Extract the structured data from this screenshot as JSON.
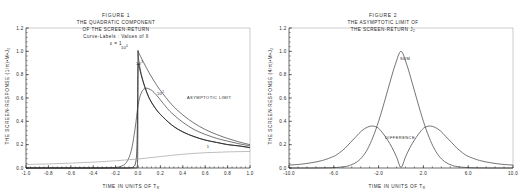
{
  "page": {
    "background_color": "#ffffff",
    "ink_color": "#1f1f1f"
  },
  "figure1": {
    "title_lines": {
      "line1": "FIGURE   1",
      "line2": "THE QUADRATIC COMPONENT",
      "line3": "OF THE SCREEN-RETURN",
      "line4": "Curve-Labels :  Values of δ",
      "line5": "ε = 1"
    },
    "ylabel": "THE SCREEN-RESPONSE  (1/π)•M•J",
    "ylabel_sub": "2",
    "xlabel": "TIME IN UNITS OF T",
    "xlabel_sub": "R",
    "annotations": {
      "asymptotic": "ASYMPTOTIC LIMIT",
      "curve_10_4_base": "10",
      "curve_10_4_exp": "4",
      "curve_10_3_base": "10",
      "curve_10_3_exp": "3",
      "curve_10_2_base": "10",
      "curve_10_2_exp": "2",
      "curve_1": "1"
    },
    "chart_data": {
      "type": "line",
      "title": "THE QUADRATIC COMPONENT OF THE SCREEN-RETURN",
      "xlabel": "TIME IN UNITS OF T_R",
      "ylabel": "THE SCREEN-RESPONSE (1/π)•M•J_2",
      "xlim": [
        -1.0,
        1.0
      ],
      "ylim": [
        0.0,
        1.2
      ],
      "xticks": [
        "-1.0",
        "-0.8",
        "-0.6",
        "-0.4",
        "-0.2",
        "0.0",
        "0.2",
        "0.4",
        "0.6",
        "0.8",
        "1.0"
      ],
      "xtick_values": [
        -1.0,
        -0.8,
        -0.6,
        -0.4,
        -0.2,
        0.0,
        0.2,
        0.4,
        0.6,
        0.8,
        1.0
      ],
      "yticks": [
        "0.0",
        "0.2",
        "0.4",
        "0.6",
        "0.8",
        "1.0",
        "1.2"
      ],
      "ytick_values": [
        0.0,
        0.2,
        0.4,
        0.6,
        0.8,
        1.0,
        1.2
      ],
      "grid": false,
      "legend": "curve labels in-plot",
      "series": [
        {
          "name": "delta = 10^4",
          "label": "10^4",
          "x": [
            -1.0,
            -0.6,
            -0.3,
            -0.12,
            -0.05,
            -0.02,
            -0.008,
            -0.003,
            -0.001,
            0.0,
            0.002,
            0.01,
            0.03,
            0.06,
            0.1,
            0.15,
            0.2,
            0.3,
            0.4,
            0.5,
            0.6,
            0.7,
            0.8,
            0.9,
            1.0
          ],
          "y": [
            0.0,
            0.0,
            0.0,
            0.0,
            0.0,
            0.001,
            0.01,
            0.1,
            0.55,
            0.98,
            0.96,
            0.9,
            0.8,
            0.7,
            0.6,
            0.52,
            0.46,
            0.37,
            0.31,
            0.27,
            0.24,
            0.22,
            0.2,
            0.19,
            0.175
          ]
        },
        {
          "name": "delta = 10^3",
          "label": "10^3",
          "x": [
            -1.0,
            -0.6,
            -0.3,
            -0.15,
            -0.08,
            -0.04,
            -0.02,
            -0.01,
            -0.004,
            0.0,
            0.004,
            0.012,
            0.03,
            0.06,
            0.1,
            0.15,
            0.2,
            0.3,
            0.4,
            0.5,
            0.6,
            0.7,
            0.8,
            0.9,
            1.0
          ],
          "y": [
            0.0,
            0.0,
            0.0,
            0.0,
            0.001,
            0.01,
            0.05,
            0.17,
            0.5,
            0.86,
            0.88,
            0.86,
            0.79,
            0.695,
            0.597,
            0.518,
            0.459,
            0.369,
            0.309,
            0.269,
            0.239,
            0.219,
            0.201,
            0.189,
            0.174
          ]
        },
        {
          "name": "delta = 10^2",
          "label": "10^2",
          "x": [
            -1.0,
            -0.5,
            -0.3,
            -0.2,
            -0.15,
            -0.11,
            -0.08,
            -0.055,
            -0.035,
            -0.02,
            -0.005,
            0.01,
            0.03,
            0.05,
            0.08,
            0.11,
            0.13,
            0.16,
            0.2,
            0.25,
            0.3,
            0.4,
            0.5,
            0.6,
            0.7,
            0.8,
            0.9,
            1.0
          ],
          "y": [
            0.0,
            0.0,
            0.001,
            0.005,
            0.015,
            0.04,
            0.09,
            0.17,
            0.28,
            0.38,
            0.5,
            0.585,
            0.645,
            0.675,
            0.684,
            0.672,
            0.66,
            0.63,
            0.584,
            0.524,
            0.472,
            0.392,
            0.33,
            0.288,
            0.255,
            0.23,
            0.208,
            0.19
          ]
        },
        {
          "name": "delta = 1",
          "label": "1",
          "x": [
            -1.0,
            -0.8,
            -0.6,
            -0.4,
            -0.2,
            0.0,
            0.2,
            0.4,
            0.6,
            0.8,
            1.0
          ],
          "y": [
            0.03,
            0.035,
            0.042,
            0.05,
            0.062,
            0.077,
            0.098,
            0.118,
            0.131,
            0.138,
            0.142
          ]
        },
        {
          "name": "asymptotic limit",
          "label": "ASYMPTOTIC LIMIT",
          "x": [
            0.0,
            0.05,
            0.1,
            0.15,
            0.2,
            0.3,
            0.4,
            0.5,
            0.6,
            0.7,
            0.8,
            0.9,
            1.0
          ],
          "y": [
            1.0,
            0.905,
            0.815,
            0.735,
            0.665,
            0.545,
            0.455,
            0.385,
            0.33,
            0.288,
            0.253,
            0.224,
            0.2
          ]
        }
      ]
    }
  },
  "figure2": {
    "title_lines": {
      "line1": "FIGURE   2",
      "line2": "THE ASYMPTOTIC LIMIT OF",
      "line3": "THE SCREEN-RETURN  J",
      "line3_sub": "2"
    },
    "ylabel": "THE SCREEN-RESPONSE  (4/π)•M•J",
    "ylabel_sub": "2",
    "xlabel": "TIME IN UNITS OF T",
    "xlabel_sub": "R",
    "annotations": {
      "sum": "SUM",
      "difference": "DIFFERENCE"
    },
    "chart_data": {
      "type": "line",
      "title": "THE ASYMPTOTIC LIMIT OF THE SCREEN-RETURN J_2",
      "xlabel": "TIME IN UNITS OF T_R",
      "ylabel": "THE SCREEN-RESPONSE (4/π)•M•J_2",
      "xlim": [
        -10.0,
        10.0
      ],
      "ylim": [
        0.0,
        1.2
      ],
      "xticks": [
        "-10.0",
        "-6.0",
        "-2.0",
        "2.0",
        "6.0",
        "10.0"
      ],
      "xtick_values": [
        -10.0,
        -6.0,
        -2.0,
        2.0,
        6.0,
        10.0
      ],
      "yticks": [
        "0.0",
        "0.2",
        "0.4",
        "0.6",
        "0.8",
        "1.0",
        "1.2"
      ],
      "ytick_values": [
        0.0,
        0.2,
        0.4,
        0.6,
        0.8,
        1.0,
        1.2
      ],
      "grid": false,
      "series": [
        {
          "name": "SUM",
          "label": "SUM",
          "x": [
            -10.0,
            -9.0,
            -8.0,
            -7.0,
            -6.0,
            -5.0,
            -4.5,
            -4.0,
            -3.5,
            -3.0,
            -2.5,
            -2.0,
            -1.5,
            -1.0,
            -0.5,
            0.0,
            0.5,
            1.0,
            1.5,
            2.0,
            2.5,
            3.0,
            3.5,
            4.0,
            4.5,
            5.0,
            6.0,
            7.0,
            8.0,
            9.0,
            10.0
          ],
          "y": [
            0.0,
            0.0,
            0.0,
            0.001,
            0.003,
            0.012,
            0.025,
            0.048,
            0.09,
            0.16,
            0.265,
            0.4,
            0.56,
            0.73,
            0.89,
            1.0,
            0.89,
            0.73,
            0.56,
            0.4,
            0.265,
            0.16,
            0.09,
            0.048,
            0.025,
            0.012,
            0.003,
            0.001,
            0.0,
            0.0,
            0.0
          ]
        },
        {
          "name": "DIFFERENCE",
          "label": "DIFFERENCE",
          "x": [
            -10.0,
            -9.0,
            -8.0,
            -7.0,
            -6.0,
            -5.5,
            -5.0,
            -4.5,
            -4.0,
            -3.5,
            -3.0,
            -2.6,
            -2.3,
            -2.0,
            -1.6,
            -1.2,
            -0.8,
            -0.4,
            0.0,
            0.4,
            0.8,
            1.2,
            1.6,
            2.0,
            2.3,
            2.6,
            3.0,
            3.5,
            4.0,
            4.5,
            5.0,
            5.5,
            6.0,
            7.0,
            8.0,
            9.0,
            10.0
          ],
          "y": [
            0.025,
            0.032,
            0.045,
            0.065,
            0.1,
            0.13,
            0.17,
            0.22,
            0.27,
            0.32,
            0.35,
            0.36,
            0.355,
            0.34,
            0.295,
            0.24,
            0.175,
            0.095,
            0.005,
            0.095,
            0.175,
            0.24,
            0.295,
            0.34,
            0.355,
            0.36,
            0.35,
            0.32,
            0.27,
            0.22,
            0.17,
            0.13,
            0.1,
            0.065,
            0.045,
            0.032,
            0.025
          ]
        }
      ]
    }
  }
}
